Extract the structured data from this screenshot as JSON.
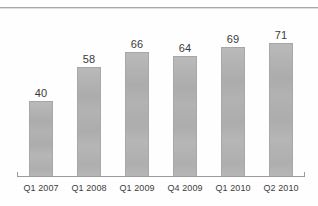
{
  "chart_data": {
    "type": "bar",
    "title": "",
    "subtitle": "",
    "xlabel": "",
    "ylabel": "",
    "categories": [
      "Q1 2007",
      "Q1 2008",
      "Q1 2009",
      "Q4 2009",
      "Q1 2010",
      "Q2 2010"
    ],
    "values": [
      40,
      58,
      66,
      64,
      69,
      71
    ],
    "data_labels": [
      "40",
      "58",
      "66",
      "64",
      "69",
      "71"
    ],
    "ylim": [
      0,
      80
    ],
    "grid": false,
    "legend": false,
    "legend_position": "none",
    "bar_color": "#b2b2b2",
    "axis_color": "#9b9b9d",
    "label_color": "#3a3a3a"
  },
  "axis": {
    "baseline_visible": true,
    "y_axis_visible": false,
    "tick_left": "",
    "tick_right": ""
  },
  "decor": {
    "top_rule": ""
  }
}
